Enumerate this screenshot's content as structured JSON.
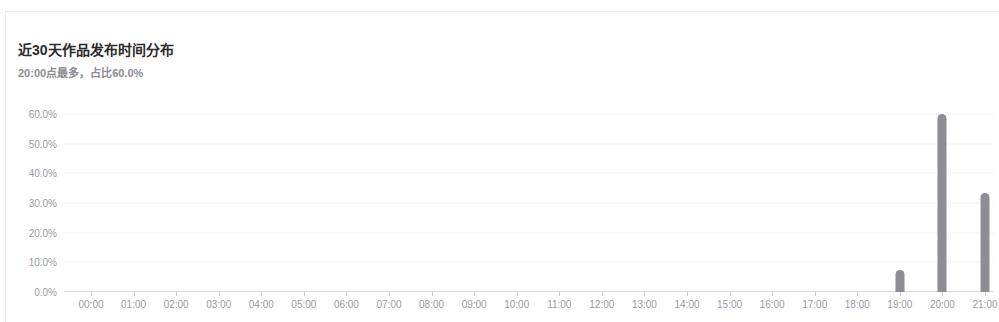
{
  "card": {
    "title": "近30天作品发布时间分布",
    "subtitle": "20:00点最多，占比60.0%"
  },
  "colors": {
    "bar": "#8d8d93",
    "axis_text": "#9a9aa2",
    "grid": "#ececed",
    "title_text": "#2b2b2b",
    "subtitle_text": "#8c8c93",
    "card_border": "#e9e9ec"
  },
  "chart_data": {
    "type": "bar",
    "title": "近30天作品发布时间分布",
    "subtitle": "20:00点最多，占比60.0%",
    "xlabel": "",
    "ylabel": "",
    "ylim": [
      0,
      60
    ],
    "ytick_labels": [
      "0.0%",
      "10.0%",
      "20.0%",
      "30.0%",
      "40.0%",
      "50.0%",
      "60.0%"
    ],
    "ytick_values": [
      0,
      10,
      20,
      30,
      40,
      50,
      60
    ],
    "grid": true,
    "legend": "none",
    "categories": [
      "00:00",
      "01:00",
      "02:00",
      "03:00",
      "04:00",
      "05:00",
      "06:00",
      "07:00",
      "08:00",
      "09:00",
      "10:00",
      "11:00",
      "12:00",
      "13:00",
      "14:00",
      "15:00",
      "16:00",
      "17:00",
      "18:00",
      "19:00",
      "20:00",
      "21:00"
    ],
    "values": [
      0,
      0,
      0,
      0,
      0,
      0,
      0,
      0,
      0,
      0,
      0,
      0,
      0,
      0,
      0,
      0,
      0,
      0,
      0,
      7.5,
      60.0,
      33.5
    ],
    "value_labels": [
      "0.0%",
      "0.0%",
      "0.0%",
      "0.0%",
      "0.0%",
      "0.0%",
      "0.0%",
      "0.0%",
      "0.0%",
      "0.0%",
      "0.0%",
      "0.0%",
      "0.0%",
      "0.0%",
      "0.0%",
      "0.0%",
      "0.0%",
      "0.0%",
      "0.0%",
      "7.5%",
      "60.0%",
      "33.5%"
    ]
  }
}
